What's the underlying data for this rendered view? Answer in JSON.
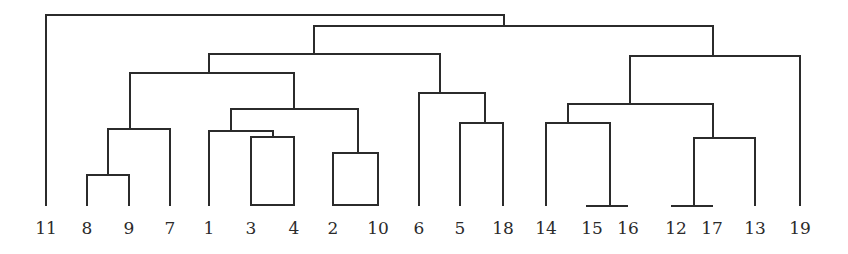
{
  "chart_data": {
    "type": "dendrogram",
    "title": "",
    "orientation": "top-down",
    "leaf_order": [
      "11",
      "8",
      "9",
      "7",
      "1",
      "3",
      "4",
      "2",
      "10",
      "6",
      "5",
      "18",
      "14",
      "15",
      "16",
      "12",
      "17",
      "13",
      "19"
    ],
    "leaves": [
      {
        "label": "11",
        "x": 46
      },
      {
        "label": "8",
        "x": 87
      },
      {
        "label": "9",
        "x": 129
      },
      {
        "label": "7",
        "x": 170
      },
      {
        "label": "1",
        "x": 209
      },
      {
        "label": "3",
        "x": 251
      },
      {
        "label": "4",
        "x": 294
      },
      {
        "label": "2",
        "x": 333
      },
      {
        "label": "10",
        "x": 378
      },
      {
        "label": "6",
        "x": 419
      },
      {
        "label": "5",
        "x": 460
      },
      {
        "label": "18",
        "x": 503
      },
      {
        "label": "14",
        "x": 546
      },
      {
        "label": "15",
        "x": 592
      },
      {
        "label": "16",
        "x": 628
      },
      {
        "label": "12",
        "x": 676
      },
      {
        "label": "17",
        "x": 712
      },
      {
        "label": "13",
        "x": 755
      },
      {
        "label": "19",
        "x": 800
      }
    ],
    "merges_relative_height": [
      {
        "clusters": [
          "15",
          "16"
        ],
        "height": 0.0
      },
      {
        "clusters": [
          "12",
          "17"
        ],
        "height": 0.0
      },
      {
        "clusters": [
          "8",
          "9"
        ],
        "height": 0.16
      },
      {
        "clusters": [
          "2",
          "10"
        ],
        "height": 0.27
      },
      {
        "clusters": [
          "3",
          "4"
        ],
        "height": 0.36
      },
      {
        "clusters": [
          "1",
          "(3,4)"
        ],
        "height": 0.39
      },
      {
        "clusters": [
          "(12,17)",
          "13"
        ],
        "height": 0.35
      },
      {
        "clusters": [
          "(8,9)",
          "7"
        ],
        "height": 0.4
      },
      {
        "clusters": [
          "5",
          "18"
        ],
        "height": 0.43
      },
      {
        "clusters": [
          "14",
          "(15,16)"
        ],
        "height": 0.43
      },
      {
        "clusters": [
          "(1,3,4)",
          "(2,10)"
        ],
        "height": 0.5
      },
      {
        "clusters": [
          "(14,15,16)",
          "(12,17,13)"
        ],
        "height": 0.54
      },
      {
        "clusters": [
          "6",
          "(5,18)"
        ],
        "height": 0.59
      },
      {
        "clusters": [
          "(8,9,7)",
          "(1,3,4,2,10)"
        ],
        "height": 0.7
      },
      {
        "clusters": [
          "(14,15,16,12,17,13)",
          "19"
        ],
        "height": 0.79
      },
      {
        "clusters": [
          "(8,9,7,1,3,4,2,10)",
          "(6,5,18)"
        ],
        "height": 0.79
      },
      {
        "clusters": [
          "(8..18)",
          "(14..19)"
        ],
        "height": 0.94
      },
      {
        "clusters": [
          "11",
          "(all others)"
        ],
        "height": 1.0
      }
    ],
    "segments": [
      [
        46,
        205,
        46,
        15
      ],
      [
        46,
        15,
        504,
        15
      ],
      [
        504,
        15,
        504,
        26
      ],
      [
        314,
        26,
        713,
        26
      ],
      [
        314,
        26,
        314,
        54
      ],
      [
        713,
        26,
        713,
        56
      ],
      [
        209,
        54,
        440,
        54
      ],
      [
        209,
        54,
        209,
        73
      ],
      [
        440,
        54,
        440,
        93
      ],
      [
        130,
        73,
        294,
        73
      ],
      [
        130,
        73,
        130,
        129
      ],
      [
        294,
        73,
        294,
        109
      ],
      [
        108,
        129,
        170,
        129
      ],
      [
        108,
        129,
        108,
        175
      ],
      [
        170,
        129,
        170,
        205
      ],
      [
        87,
        175,
        129,
        175
      ],
      [
        87,
        175,
        87,
        205
      ],
      [
        129,
        175,
        129,
        205
      ],
      [
        231,
        109,
        358,
        109
      ],
      [
        231,
        109,
        231,
        131
      ],
      [
        358,
        109,
        358,
        153
      ],
      [
        209,
        131,
        273,
        131
      ],
      [
        209,
        131,
        209,
        205
      ],
      [
        273,
        131,
        273,
        137
      ],
      [
        251,
        137,
        294,
        137
      ],
      [
        251,
        137,
        251,
        205
      ],
      [
        294,
        137,
        294,
        205
      ],
      [
        251,
        205,
        294,
        205
      ],
      [
        333,
        153,
        378,
        153
      ],
      [
        333,
        153,
        333,
        205
      ],
      [
        378,
        153,
        378,
        205
      ],
      [
        333,
        205,
        378,
        205
      ],
      [
        419,
        93,
        485,
        93
      ],
      [
        419,
        93,
        419,
        205
      ],
      [
        485,
        93,
        485,
        123
      ],
      [
        460,
        123,
        503,
        123
      ],
      [
        460,
        123,
        460,
        205
      ],
      [
        503,
        123,
        503,
        205
      ],
      [
        630,
        56,
        800,
        56
      ],
      [
        630,
        56,
        630,
        104
      ],
      [
        800,
        56,
        800,
        205
      ],
      [
        568,
        104,
        713,
        104
      ],
      [
        568,
        104,
        568,
        123
      ],
      [
        713,
        104,
        713,
        138
      ],
      [
        546,
        123,
        610,
        123
      ],
      [
        546,
        123,
        546,
        205
      ],
      [
        610,
        123,
        610,
        206
      ],
      [
        587,
        206,
        627,
        206
      ],
      [
        694,
        138,
        755,
        138
      ],
      [
        694,
        138,
        694,
        206
      ],
      [
        755,
        138,
        755,
        205
      ],
      [
        672,
        206,
        712,
        206
      ]
    ],
    "label_y": 234,
    "line_color": "#2b2b2b",
    "axes": "none",
    "grid": false,
    "legend": "none"
  }
}
